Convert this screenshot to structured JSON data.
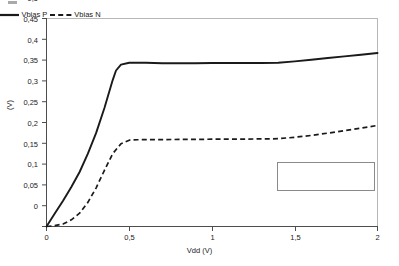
{
  "chart_data": {
    "type": "line",
    "title": "",
    "xlabel": "Vdd (V)",
    "ylabel": "(V)",
    "xlim": [
      0,
      2
    ],
    "ylim": [
      0,
      0.5
    ],
    "grid": false,
    "legend_position": "inside-right",
    "xticks": [
      "0",
      "0,5",
      "1",
      "1,5",
      "2"
    ],
    "xtick_values": [
      0,
      0.5,
      1,
      1.5,
      2
    ],
    "yticks": [
      "0",
      "0,05",
      "0,1",
      "0,15",
      "0,2",
      "0,25",
      "0,3",
      "0,35",
      "0,4",
      "0,45",
      "0,5"
    ],
    "ytick_values": [
      0,
      0.05,
      0.1,
      0.15,
      0.2,
      0.25,
      0.3,
      0.35,
      0.4,
      0.45,
      0.5
    ],
    "series": [
      {
        "name": "Vbias P",
        "style": "solid",
        "color": "#1a1a1a",
        "x": [
          0,
          0.05,
          0.1,
          0.15,
          0.2,
          0.25,
          0.3,
          0.35,
          0.4,
          0.42,
          0.45,
          0.5,
          0.6,
          0.7,
          0.8,
          0.9,
          1.0,
          1.1,
          1.2,
          1.3,
          1.4,
          1.5,
          1.6,
          1.7,
          1.8,
          1.9,
          2.0
        ],
        "y": [
          0.0,
          0.031,
          0.062,
          0.095,
          0.131,
          0.175,
          0.225,
          0.285,
          0.352,
          0.375,
          0.389,
          0.3935,
          0.3935,
          0.3925,
          0.3925,
          0.3925,
          0.393,
          0.393,
          0.393,
          0.3932,
          0.3935,
          0.397,
          0.401,
          0.405,
          0.409,
          0.413,
          0.417
        ]
      },
      {
        "name": "Vbias N",
        "style": "dashed",
        "color": "#1a1a1a",
        "x": [
          0,
          0.05,
          0.1,
          0.15,
          0.2,
          0.25,
          0.3,
          0.35,
          0.4,
          0.45,
          0.5,
          0.55,
          0.6,
          0.7,
          0.8,
          0.9,
          1.0,
          1.1,
          1.2,
          1.3,
          1.4,
          1.5,
          1.6,
          1.7,
          1.8,
          1.9,
          2.0
        ],
        "y": [
          0.0,
          0.002,
          0.006,
          0.016,
          0.032,
          0.058,
          0.093,
          0.135,
          0.175,
          0.199,
          0.2075,
          0.2085,
          0.209,
          0.209,
          0.2092,
          0.2095,
          0.2098,
          0.21,
          0.2102,
          0.2105,
          0.211,
          0.2145,
          0.219,
          0.2245,
          0.2305,
          0.2365,
          0.243
        ]
      }
    ]
  },
  "legend": {
    "entries": [
      {
        "label": "Vbias P",
        "style": "solid"
      },
      {
        "label": "Vbias N",
        "style": "dashed"
      }
    ]
  },
  "colors": {
    "axis": "#4d4d4d",
    "plot_border": "#b7b7b7",
    "text": "#1a1a1a",
    "series": "#1a1a1a"
  }
}
